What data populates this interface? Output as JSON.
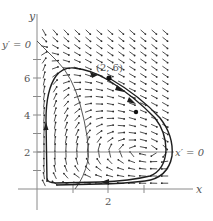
{
  "chart_data": {
    "type": "line",
    "title": "",
    "xlabel": "x",
    "ylabel": "y",
    "x_ticks": [
      1,
      2,
      3
    ],
    "x_tick_labels": [
      "",
      "2",
      ""
    ],
    "y_ticks": [
      1,
      2,
      3,
      4,
      5,
      6,
      7
    ],
    "y_tick_labels": [
      "",
      "2",
      "",
      "4",
      "",
      "6",
      ""
    ],
    "xlim": [
      0,
      4.4
    ],
    "ylim": [
      0,
      8.5
    ],
    "grid": false,
    "direction_field": {
      "x_range": [
        0.1,
        3.7
      ],
      "y_range": [
        0.2,
        8.1
      ],
      "dx_px": 11,
      "dy_px": 7.2
    },
    "nullclines": [
      {
        "label": "x' = 0",
        "kind": "horizontal line",
        "y": 2
      },
      {
        "label": "y' = 0",
        "kind": "curve",
        "points": [
          [
            0,
            8.2
          ],
          [
            0.9,
            6.5
          ],
          [
            1.2,
            4.6
          ],
          [
            1.45,
            2.5
          ],
          [
            1.35,
            1.0
          ],
          [
            1.05,
            0
          ]
        ]
      }
    ],
    "trajectories": [
      {
        "name": "closed orbit (inner)",
        "points": [
          [
            0.25,
            0.3
          ],
          [
            0.25,
            3.0
          ],
          [
            0.35,
            5.2
          ],
          [
            0.8,
            6.5
          ],
          [
            1.6,
            6.2
          ],
          [
            2.6,
            4.8
          ],
          [
            3.5,
            2.6
          ],
          [
            3.55,
            1.6
          ],
          [
            3.2,
            0.6
          ],
          [
            2.0,
            0.3
          ],
          [
            0.6,
            0.3
          ],
          [
            0.25,
            0.5
          ]
        ]
      },
      {
        "name": "trajectory through (2, 6)",
        "points": [
          [
            2.0,
            6.0
          ],
          [
            2.8,
            4.8
          ],
          [
            3.5,
            3.0
          ],
          [
            3.75,
            2.0
          ],
          [
            3.6,
            1.2
          ],
          [
            3.0,
            0.55
          ],
          [
            2.0,
            0.45
          ],
          [
            0.6,
            0.45
          ]
        ]
      }
    ],
    "points": [
      {
        "label": "(2, 6)",
        "x": 2,
        "y": 6
      },
      {
        "label": "",
        "x": 2.75,
        "y": 4.2
      }
    ],
    "annotations": [
      "y' = 0",
      "x' = 0",
      "(2, 6)"
    ]
  },
  "labels": {
    "x_axis": "x",
    "y_axis": "y",
    "y_nullcline": "y′ = 0",
    "x_nullcline": "x′ = 0",
    "point": "(2, 6)",
    "tick_2x": "2",
    "tick_2y": "2",
    "tick_4y": "4",
    "tick_6y": "6"
  },
  "colors": {
    "axis": "#8a8a8a",
    "curve": "#1e1e1e",
    "thin": "#444444",
    "arrow": "#2a2a2a"
  }
}
